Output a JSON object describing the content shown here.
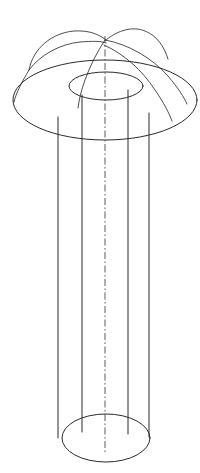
{
  "figure": {
    "domain": "technical-line-drawing",
    "background_color": "#ffffff",
    "line_color": "#2b2b2b",
    "axis_color": "#4a4a4a",
    "canvas": {
      "width": 200,
      "height": 473
    },
    "line_style": "thin-solid",
    "axis_style": "dash-dot-centerline",
    "projection": "oblique-isometric"
  },
  "geometry": {
    "axis": {
      "name": "centerline",
      "x": 105,
      "y_top": 36,
      "y_bottom": 452
    },
    "outer_flange_ellipse": {
      "name": "outer-brim-ellipse",
      "cx": 105,
      "cy": 100,
      "rx": 92,
      "ry": 40
    },
    "inner_bore_top_ellipse": {
      "name": "bore-top-ellipse",
      "cx": 106,
      "cy": 86,
      "rx": 37,
      "ry": 14
    },
    "bottom_ellipse": {
      "name": "cylinder-bottom-ellipse",
      "cx": 106,
      "cy": 438,
      "rx": 44,
      "ry": 24
    },
    "vertical_lines": [
      {
        "name": "outer-wall-left",
        "x": 58,
        "y_top": 117,
        "y_bottom": 438
      },
      {
        "name": "bore-wall-left",
        "x": 82,
        "y_top": 95,
        "y_bottom": 432
      },
      {
        "name": "bore-wall-right",
        "x": 128,
        "y_top": 90,
        "y_bottom": 434
      },
      {
        "name": "outer-wall-right",
        "x": 149,
        "y_top": 113,
        "y_bottom": 437
      }
    ],
    "crown_arcs": [
      {
        "name": "crown-arc-left-outer",
        "from": [
          30,
          68
        ],
        "apex": [
          70,
          33
        ],
        "to": [
          105,
          40
        ]
      },
      {
        "name": "crown-arc-left-inner",
        "from": [
          30,
          68
        ],
        "apex": [
          72,
          42
        ],
        "to": [
          106,
          42
        ]
      },
      {
        "name": "crown-arc-right-outer",
        "from": [
          105,
          40
        ],
        "apex": [
          140,
          28
        ],
        "to": [
          168,
          58
        ]
      },
      {
        "name": "crown-arc-right-mid",
        "from": [
          105,
          41
        ],
        "apex": [
          150,
          52
        ],
        "to": [
          186,
          100
        ]
      },
      {
        "name": "crown-arc-right-low",
        "from": [
          104,
          45
        ],
        "apex": [
          145,
          72
        ],
        "to": [
          172,
          120
        ]
      },
      {
        "name": "crown-arc-down-left",
        "from": [
          105,
          40
        ],
        "apex": [
          86,
          72
        ],
        "to": [
          78,
          108
        ]
      }
    ],
    "counts": {
      "ellipses": 3,
      "vertical_lines": 4,
      "crown_arcs": 6,
      "centerlines": 1
    }
  }
}
